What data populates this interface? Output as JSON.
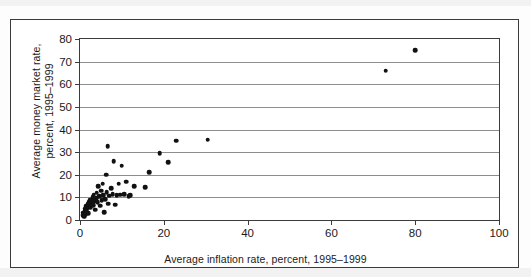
{
  "figure": {
    "kind": "scatter-plot-figure"
  },
  "chart_data": {
    "type": "scatter",
    "title": "",
    "xlabel": "Average inflation rate, percent, 1995–1999",
    "ylabel": "Average money market rate,\npercent, 1995–1999",
    "xlim": [
      0,
      100
    ],
    "ylim": [
      0,
      80
    ],
    "xticks": [
      0,
      20,
      40,
      60,
      80,
      100
    ],
    "yticks": [
      0,
      10,
      20,
      30,
      40,
      50,
      60,
      70,
      80
    ],
    "xtick_labels": [
      "0",
      "20",
      "40",
      "60",
      "80",
      "100"
    ],
    "ytick_labels": [
      "0",
      "10",
      "20",
      "30",
      "40",
      "50",
      "60",
      "70",
      "80"
    ],
    "grid": "horizontal",
    "legend": null,
    "marker": "filled-circle",
    "marker_color": "#111111",
    "series": [
      {
        "name": "Countries",
        "points": [
          [
            0.6,
            2.0
          ],
          [
            0.8,
            3.2
          ],
          [
            1.0,
            1.5
          ],
          [
            1.1,
            4.0
          ],
          [
            1.3,
            5.0
          ],
          [
            1.4,
            2.6
          ],
          [
            1.5,
            6.2
          ],
          [
            1.6,
            4.4
          ],
          [
            1.8,
            7.0
          ],
          [
            1.9,
            5.4
          ],
          [
            2.0,
            3.0
          ],
          [
            2.1,
            8.0
          ],
          [
            2.2,
            6.0
          ],
          [
            2.4,
            9.0
          ],
          [
            2.5,
            7.4
          ],
          [
            2.6,
            5.6
          ],
          [
            2.8,
            8.6
          ],
          [
            3.0,
            10.0
          ],
          [
            3.1,
            6.6
          ],
          [
            3.3,
            11.2
          ],
          [
            3.4,
            8.2
          ],
          [
            3.6,
            4.6
          ],
          [
            3.8,
            9.6
          ],
          [
            4.0,
            12.0
          ],
          [
            4.2,
            7.8
          ],
          [
            4.4,
            15.0
          ],
          [
            4.6,
            10.4
          ],
          [
            4.8,
            6.4
          ],
          [
            5.0,
            13.0
          ],
          [
            5.2,
            8.8
          ],
          [
            5.4,
            16.0
          ],
          [
            5.6,
            11.0
          ],
          [
            5.8,
            3.4
          ],
          [
            6.0,
            9.2
          ],
          [
            6.2,
            20.0
          ],
          [
            6.4,
            12.4
          ],
          [
            6.6,
            32.5
          ],
          [
            6.8,
            7.2
          ],
          [
            7.0,
            10.8
          ],
          [
            7.4,
            14.0
          ],
          [
            7.8,
            11.4
          ],
          [
            8.0,
            26.0
          ],
          [
            8.4,
            6.8
          ],
          [
            8.8,
            11.0
          ],
          [
            9.2,
            16.0
          ],
          [
            9.6,
            11.2
          ],
          [
            10.0,
            24.0
          ],
          [
            10.6,
            11.4
          ],
          [
            11.0,
            17.0
          ],
          [
            11.6,
            10.6
          ],
          [
            12.0,
            11.0
          ],
          [
            13.0,
            15.0
          ],
          [
            15.5,
            14.5
          ],
          [
            16.5,
            21.0
          ],
          [
            19.0,
            29.5
          ],
          [
            21.0,
            25.5
          ],
          [
            23.0,
            35.0
          ],
          [
            30.5,
            35.5
          ],
          [
            73.0,
            66.0
          ],
          [
            80.0,
            75.0
          ]
        ]
      }
    ]
  }
}
